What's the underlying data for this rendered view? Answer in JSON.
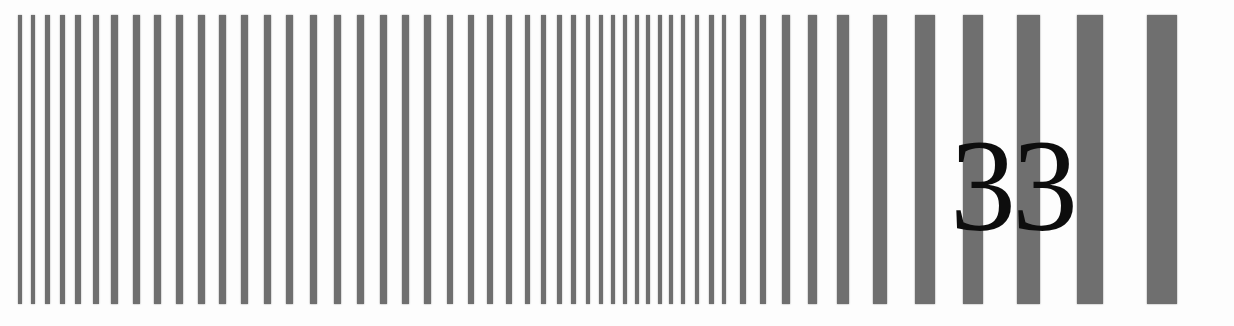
{
  "test_chart": {
    "label": "33",
    "bar_color": "#6f6f6f",
    "bar_top": 15,
    "bar_height": 289,
    "bars": [
      {
        "x": 20,
        "w": 4
      },
      {
        "x": 33,
        "w": 4
      },
      {
        "x": 47,
        "w": 5
      },
      {
        "x": 62,
        "w": 5
      },
      {
        "x": 78,
        "w": 6
      },
      {
        "x": 96,
        "w": 6
      },
      {
        "x": 114,
        "w": 7
      },
      {
        "x": 136,
        "w": 7
      },
      {
        "x": 157,
        "w": 7
      },
      {
        "x": 179,
        "w": 7
      },
      {
        "x": 201,
        "w": 7
      },
      {
        "x": 222,
        "w": 7
      },
      {
        "x": 244,
        "w": 7
      },
      {
        "x": 267,
        "w": 7
      },
      {
        "x": 289,
        "w": 7
      },
      {
        "x": 313,
        "w": 7
      },
      {
        "x": 337,
        "w": 7
      },
      {
        "x": 360,
        "w": 7
      },
      {
        "x": 383,
        "w": 7
      },
      {
        "x": 405,
        "w": 7
      },
      {
        "x": 427,
        "w": 7
      },
      {
        "x": 450,
        "w": 6
      },
      {
        "x": 471,
        "w": 6
      },
      {
        "x": 490,
        "w": 6
      },
      {
        "x": 509,
        "w": 6
      },
      {
        "x": 527,
        "w": 5
      },
      {
        "x": 543,
        "w": 5
      },
      {
        "x": 559,
        "w": 5
      },
      {
        "x": 573,
        "w": 5
      },
      {
        "x": 588,
        "w": 4
      },
      {
        "x": 601,
        "w": 4
      },
      {
        "x": 613,
        "w": 4
      },
      {
        "x": 625,
        "w": 4
      },
      {
        "x": 637,
        "w": 4
      },
      {
        "x": 648,
        "w": 4
      },
      {
        "x": 660,
        "w": 4
      },
      {
        "x": 671,
        "w": 4
      },
      {
        "x": 683,
        "w": 4
      },
      {
        "x": 697,
        "w": 4
      },
      {
        "x": 711,
        "w": 5
      },
      {
        "x": 724,
        "w": 4
      },
      {
        "x": 743,
        "w": 6
      },
      {
        "x": 763,
        "w": 6
      },
      {
        "x": 786,
        "w": 8
      },
      {
        "x": 812,
        "w": 9
      },
      {
        "x": 843,
        "w": 12
      },
      {
        "x": 880,
        "w": 14
      },
      {
        "x": 925,
        "w": 20
      },
      {
        "x": 973,
        "w": 20
      },
      {
        "x": 1028,
        "w": 23
      },
      {
        "x": 1090,
        "w": 26
      },
      {
        "x": 1162,
        "w": 30
      }
    ]
  }
}
